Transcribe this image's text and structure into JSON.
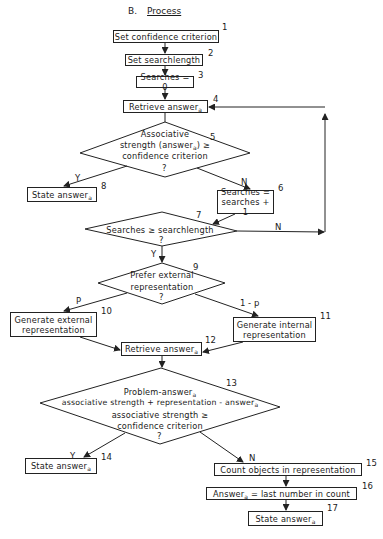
{
  "title": {
    "prefix": "B.",
    "text": "Process"
  },
  "nodes": {
    "n1": {
      "num": "1",
      "text": "Set confidence criterion"
    },
    "n2": {
      "num": "2",
      "text": "Set searchlength"
    },
    "n3": {
      "num": "3",
      "text": "Searches = 0"
    },
    "n4": {
      "num": "4",
      "text": "Retrieve answer",
      "sub": "a"
    },
    "n5": {
      "num": "5",
      "line1": "Associative",
      "line2a": "strength (answer",
      "line2sub": "a",
      "line2b": ") ≥",
      "line3": "confidence criterion",
      "q": "?"
    },
    "n6": {
      "num": "6",
      "line1": "Searches =",
      "line2": "searches + 1"
    },
    "n7": {
      "num": "7",
      "text": "Searches ≥ searchlength",
      "q": "?"
    },
    "n8": {
      "num": "8",
      "text": "State answer",
      "sub": "a"
    },
    "n9": {
      "num": "9",
      "line1": "Prefer external",
      "line2": "representation",
      "q": "?"
    },
    "n10": {
      "num": "10",
      "line1": "Generate external",
      "line2": "representation"
    },
    "n11": {
      "num": "11",
      "line1": "Generate internal",
      "line2": "representation"
    },
    "n12": {
      "num": "12",
      "text": "Retrieve answer",
      "sub": "a"
    },
    "n13": {
      "num": "13",
      "line1": "Problem-answer",
      "line1sub": "a",
      "line2": "associative strength + representation - answer",
      "line2sub": "a",
      "line3": "associative strength ≥",
      "line4": "confidence criterion",
      "q": "?"
    },
    "n14": {
      "num": "14",
      "text": "State answer",
      "sub": "a"
    },
    "n15": {
      "num": "15",
      "text": "Count objects in representation"
    },
    "n16": {
      "num": "16",
      "texta": "Answer",
      "sub": "a",
      "textb": " = last number in count"
    },
    "n17": {
      "num": "17",
      "text": "State answer",
      "sub": "a"
    }
  },
  "edges": {
    "e5_yes": "Y",
    "e5_no": "N",
    "e7_yes": "Y",
    "e7_no": "N",
    "e9_left": "P",
    "e9_right": "1 - p",
    "e13_yes": "Y",
    "e13_no": "N"
  }
}
